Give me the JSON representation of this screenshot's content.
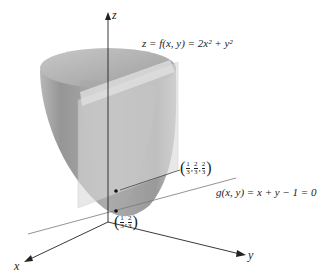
{
  "diagram": {
    "type": "3d-surface-with-plane",
    "surface_label": "z = f(x, y) = 2x² + y²",
    "plane_label": "g(x, y) = x + y − 1 = 0",
    "axes": {
      "x": "x",
      "y": "y",
      "z": "z"
    },
    "points": [
      {
        "name": "surface-point",
        "coords": [
          {
            "num": "1",
            "den": "3"
          },
          {
            "num": "2",
            "den": "3"
          },
          {
            "num": "2",
            "den": "3"
          }
        ]
      },
      {
        "name": "plane-point",
        "coords": [
          {
            "num": "1",
            "den": "3"
          },
          {
            "num": "2",
            "den": "3"
          }
        ]
      }
    ],
    "colors": {
      "surface_outer": "#9a9a9a",
      "surface_inner": "#c4c4c4",
      "plane": "#d6d6d6",
      "axes": "#222222"
    }
  }
}
